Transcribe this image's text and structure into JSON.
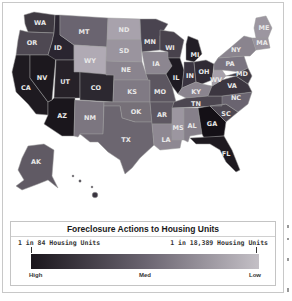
{
  "map": {
    "title": "Foreclosure Actions to Housing Units",
    "states": [
      {
        "code": "WA",
        "label": "WA",
        "shade": "#3f3a42"
      },
      {
        "code": "OR",
        "label": "OR",
        "shade": "#4e4852"
      },
      {
        "code": "CA",
        "label": "CA",
        "shade": "#1e1a20"
      },
      {
        "code": "NV",
        "label": "NV",
        "shade": "#1c181e"
      },
      {
        "code": "ID",
        "label": "ID",
        "shade": "#2a2530"
      },
      {
        "code": "MT",
        "label": "MT",
        "shade": "#6a6470"
      },
      {
        "code": "WY",
        "label": "WY",
        "shade": "#b0aab4"
      },
      {
        "code": "UT",
        "label": "UT",
        "shade": "#262128"
      },
      {
        "code": "AZ",
        "label": "AZ",
        "shade": "#1a161c"
      },
      {
        "code": "CO",
        "label": "CO",
        "shade": "#2c2830"
      },
      {
        "code": "NM",
        "label": "NM",
        "shade": "#7c7680"
      },
      {
        "code": "ND",
        "label": "ND",
        "shade": "#a8a2ac"
      },
      {
        "code": "SD",
        "label": "SD",
        "shade": "#9a949e"
      },
      {
        "code": "NE",
        "label": "NE",
        "shade": "#8a848e"
      },
      {
        "code": "KS",
        "label": "KS",
        "shade": "#807a84"
      },
      {
        "code": "OK",
        "label": "OK",
        "shade": "#767078"
      },
      {
        "code": "TX",
        "label": "TX",
        "shade": "#6c6670"
      },
      {
        "code": "MN",
        "label": "MN",
        "shade": "#4a4450"
      },
      {
        "code": "IA",
        "label": "IA",
        "shade": "#8c8690"
      },
      {
        "code": "MO",
        "label": "MO",
        "shade": "#5c5660"
      },
      {
        "code": "AR",
        "label": "AR",
        "shade": "#5e5862"
      },
      {
        "code": "LA",
        "label": "LA",
        "shade": "#8e8892"
      },
      {
        "code": "WI",
        "label": "WI",
        "shade": "#48424c"
      },
      {
        "code": "IL",
        "label": "IL",
        "shade": "#1e1a22"
      },
      {
        "code": "MI",
        "label": "MI",
        "shade": "#221e26"
      },
      {
        "code": "IN",
        "label": "IN",
        "shade": "#3a3440"
      },
      {
        "code": "OH",
        "label": "OH",
        "shade": "#302a34"
      },
      {
        "code": "KY",
        "label": "KY",
        "shade": "#8a848e"
      },
      {
        "code": "TN",
        "label": "TN",
        "shade": "#4c4650"
      },
      {
        "code": "MS",
        "label": "MS",
        "shade": "#9c96a0"
      },
      {
        "code": "AL",
        "label": "AL",
        "shade": "#86808a"
      },
      {
        "code": "GA",
        "label": "GA",
        "shade": "#141016"
      },
      {
        "code": "FL",
        "label": "FL",
        "shade": "#1e1a20"
      },
      {
        "code": "SC",
        "label": "SC",
        "shade": "#4e4852"
      },
      {
        "code": "NC",
        "label": "NC",
        "shade": "#6a6470"
      },
      {
        "code": "VA",
        "label": "VA",
        "shade": "#3c3640"
      },
      {
        "code": "WV",
        "label": "WV",
        "shade": "#a6a0aa"
      },
      {
        "code": "PA",
        "label": "PA",
        "shade": "#7a7480"
      },
      {
        "code": "NY",
        "label": "NY",
        "shade": "#8a848e"
      },
      {
        "code": "MD",
        "label": "MD",
        "shade": "#403a44"
      },
      {
        "code": "MA",
        "label": "MA",
        "shade": "#9a949e"
      },
      {
        "code": "ME",
        "label": "ME",
        "shade": "#9c96a0"
      },
      {
        "code": "AK",
        "label": "AK",
        "shade": "#605a64"
      },
      {
        "code": "HI",
        "label": "",
        "shade": "#3a3440"
      }
    ]
  },
  "legend": {
    "title": "Foreclosure Actions to Housing Units",
    "left_label": "1 in 84 Housing Units",
    "right_label": "1 in 18,389 Housing Units",
    "scale_high": "High",
    "scale_med": "Med",
    "scale_low": "Low",
    "gradient_start": "#1a161c",
    "gradient_mid": "#6a6470",
    "gradient_end": "#c4c0c6"
  }
}
